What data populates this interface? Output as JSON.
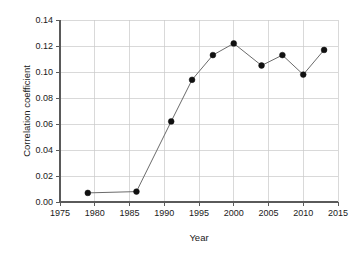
{
  "chart_data": {
    "type": "line",
    "title": "",
    "xlabel": "Year",
    "ylabel": "Correlation coefficient",
    "x": [
      1979,
      1986,
      1991,
      1994,
      1997,
      2000,
      2004,
      2007,
      2010,
      2013
    ],
    "values": [
      0.007,
      0.008,
      0.062,
      0.094,
      0.113,
      0.122,
      0.105,
      0.113,
      0.098,
      0.117
    ],
    "series": [
      {
        "name": "Correlation coefficient",
        "x": [
          1979,
          1986,
          1991,
          1994,
          1997,
          2000,
          2004,
          2007,
          2010,
          2013
        ],
        "values": [
          0.007,
          0.008,
          0.062,
          0.094,
          0.113,
          0.122,
          0.105,
          0.113,
          0.098,
          0.117
        ]
      }
    ],
    "xlim": [
      1975,
      2015
    ],
    "ylim": [
      0.0,
      0.14
    ],
    "xticks": [
      1975,
      1980,
      1985,
      1990,
      1995,
      2000,
      2005,
      2010,
      2015
    ],
    "xtick_labels": [
      "1975",
      "1980",
      "1985",
      "1990",
      "1995",
      "2000",
      "2005",
      "2010",
      "2015"
    ],
    "yticks": [
      0.0,
      0.02,
      0.04,
      0.06,
      0.08,
      0.1,
      0.12,
      0.14
    ],
    "ytick_labels": [
      "0.00",
      "0.02",
      "0.04",
      "0.06",
      "0.08",
      "0.10",
      "0.12",
      "0.14"
    ],
    "grid": true,
    "grid_axis": "both",
    "legend": null,
    "legend_position": "none",
    "marker": "filled-circle",
    "marker_color": "#111111",
    "line_color": "#6b6b6b",
    "grid_color": "#c9c9c9",
    "axis_color": "#5a5a5a",
    "background_color": "#ffffff"
  },
  "layout": {
    "plot_left": 60,
    "plot_right": 338,
    "plot_top": 20,
    "plot_bottom": 202
  }
}
